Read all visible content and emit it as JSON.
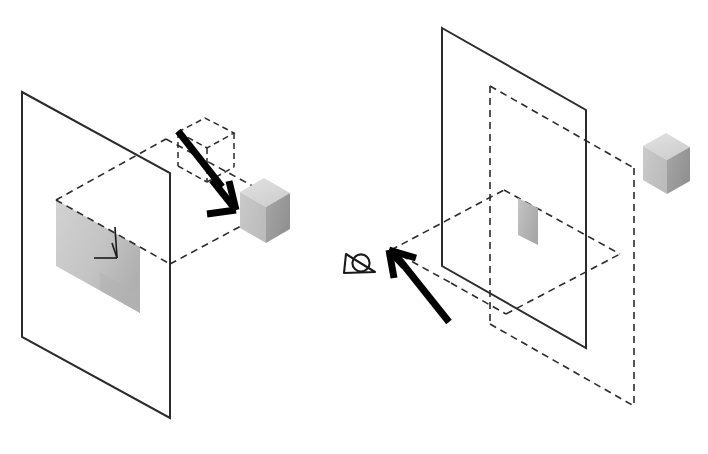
{
  "figure": {
    "title": "Projection geometry: object, projection plane and viewing direction",
    "background_color": "#ffffff",
    "width": 708,
    "height": 454,
    "stroke_color": "#2b2b2b",
    "dash_color": "#2b2b2b",
    "arrow_color": "#000000"
  },
  "palette": {
    "cube_top": "#d9d9d9",
    "cube_left": "#c3c3c3",
    "cube_right": "#9d9d9d",
    "shadow_fill": "#c9c9c9",
    "shadow_fill_dark": "#b4b4b4",
    "patch_fill": "#b9b9b9",
    "outline": "#2b2b2b"
  },
  "panels": [
    {
      "id": "left-panel",
      "name": "projection-onto-plane",
      "label": "",
      "elements": {
        "image_plane": {
          "name": "image-plane",
          "points": "22,92 170,173 170,418 22,337",
          "style": "solid"
        },
        "ground_plane": {
          "name": "ground-plane-dashed",
          "points": "56,200 170,262 280,200 166,139",
          "style": "dashed"
        },
        "ground_plane_extension": {
          "name": "ground-plane-extension-dashed",
          "points": "170,262 170,262 292,195 292,195",
          "style": "dashed"
        },
        "shadow_quad": {
          "name": "projected-shadow-region",
          "points": "56,200 56,266 140,313 140,247",
          "style": "filled"
        },
        "ghost_cube": {
          "name": "ghost-cube-dashed",
          "style": "dashed"
        },
        "solid_cube": {
          "name": "solid-cube",
          "style": "shaded"
        },
        "thick_arrow": {
          "name": "projection-direction-arrow",
          "from": "178,134",
          "to": "236,209",
          "style": "thick"
        },
        "thin_arrow": {
          "name": "shadow-pointer-arrow",
          "from": "115,230",
          "to": "92,258",
          "style": "thin"
        }
      }
    },
    {
      "id": "right-panel",
      "name": "viewing-direction-view",
      "label": "",
      "elements": {
        "image_plane": {
          "name": "image-plane",
          "points": "442,28 586,110 586,348 442,266",
          "style": "solid"
        },
        "back_plane": {
          "name": "back-plane-dashed",
          "points": "490,86 634,168 634,406 490,324",
          "style": "dashed"
        },
        "ground_plane": {
          "name": "ground-plane-dashed",
          "points": "392,253 506,315 618,253 504,191",
          "style": "dashed"
        },
        "patch": {
          "name": "projected-patch",
          "points": "518,200 536,210 536,245 518,235",
          "style": "filled"
        },
        "solid_cube": {
          "name": "solid-cube",
          "style": "shaded"
        },
        "thick_arrow": {
          "name": "viewing-direction-arrow",
          "from": "449,323",
          "to": "391,251",
          "style": "thick"
        },
        "eye_symbol": {
          "name": "eye-symbol",
          "description": "triangle with circle denoting observer eye",
          "center": "359,265"
        }
      }
    }
  ],
  "annotations": {
    "eye_icon_name": "eye-icon",
    "left_arrow_icon_name": "arrow-down-right-icon",
    "right_arrow_icon_name": "arrow-up-left-icon"
  }
}
